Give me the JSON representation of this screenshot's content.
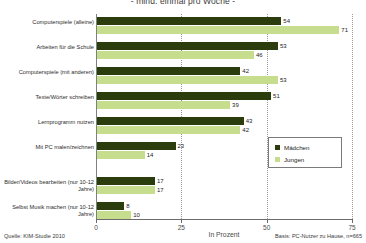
{
  "chart_data": {
    "type": "bar",
    "orientation": "horizontal",
    "title": "- mind. einmal pro Woche -",
    "title_line1": "",
    "xlabel": "In Prozent",
    "ylabel": "",
    "xlim": [
      0,
      75
    ],
    "xticks": [
      "0",
      "25",
      "50",
      "75"
    ],
    "grid": true,
    "legend_position": "right-middle",
    "categories": [
      "Computerspiele (alleine)",
      "Arbeiten für die Schule",
      "Computerspiele (mit anderen)",
      "Texte/Wörter schreiben",
      "Lernprogramm nutzen",
      "Mit PC malen/zeichnen",
      "Bilder/Videos bearbeiten (nur 10-12 Jahre)",
      "Selbst Musik machen (nur 10-12 Jahre)"
    ],
    "series": [
      {
        "name": "Mädchen",
        "color": "#2c3d0d",
        "values": [
          54,
          53,
          42,
          51,
          43,
          23,
          17,
          8
        ]
      },
      {
        "name": "Jungen",
        "color": "#c6dd8d",
        "values": [
          71,
          46,
          53,
          39,
          42,
          14,
          17,
          10
        ]
      }
    ]
  },
  "legend": {
    "items": [
      {
        "label": "Mädchen"
      },
      {
        "label": "Jungen"
      }
    ]
  },
  "footer": {
    "source": "Quelle: KIM-Studie 2010",
    "basis": "Basis: PC-Nutzer zu Hause, n=665"
  },
  "colors": {
    "maedchen": "#2c3d0d",
    "jungen": "#c6dd8d",
    "axis": "#6b6b6b",
    "grid": "#9a9a9a"
  }
}
